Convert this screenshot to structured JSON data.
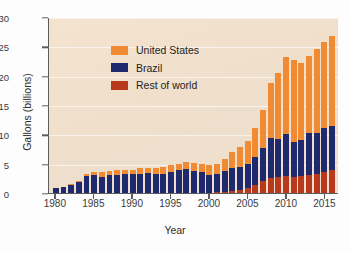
{
  "chart_data": {
    "type": "bar",
    "stacked": true,
    "title": "",
    "xlabel": "Year",
    "ylabel": "Gallons (billions)",
    "ylim": [
      0,
      30
    ],
    "ytick_values": [
      0,
      5,
      10,
      15,
      20,
      25,
      30
    ],
    "ytick_labels": [
      "0",
      "5",
      "10",
      "15",
      "20",
      "25",
      "30"
    ],
    "xtick_labels": [
      "1980",
      "1985",
      "1990",
      "1995",
      "2000",
      "2005",
      "2010",
      "2015"
    ],
    "grid": true,
    "legend_position": "top-left",
    "categories": [
      "1980",
      "1981",
      "1982",
      "1983",
      "1984",
      "1985",
      "1986",
      "1987",
      "1988",
      "1989",
      "1990",
      "1991",
      "1992",
      "1993",
      "1994",
      "1995",
      "1996",
      "1997",
      "1998",
      "1999",
      "2000",
      "2001",
      "2002",
      "2003",
      "2004",
      "2005",
      "2006",
      "2007",
      "2008",
      "2009",
      "2010",
      "2011",
      "2012",
      "2013",
      "2014",
      "2015",
      "2016"
    ],
    "series": [
      {
        "name": "Rest of world",
        "color": "#b8391b",
        "values": [
          0.0,
          0.0,
          0.0,
          0.0,
          0.0,
          0.0,
          0.0,
          0.0,
          0.0,
          0.0,
          0.0,
          0.0,
          0.0,
          0.0,
          0.0,
          0.0,
          0.0,
          0.0,
          0.0,
          0.0,
          0.0,
          0.1,
          0.2,
          0.3,
          0.5,
          0.8,
          1.4,
          2.1,
          2.5,
          2.7,
          2.9,
          2.8,
          2.9,
          3.1,
          3.3,
          3.6,
          3.9
        ]
      },
      {
        "name": "Brazil",
        "color": "#1f2a6e",
        "values": [
          0.8,
          1.0,
          1.4,
          1.9,
          2.9,
          3.0,
          2.8,
          3.0,
          3.1,
          3.2,
          3.2,
          3.3,
          3.4,
          3.3,
          3.3,
          3.5,
          3.9,
          4.1,
          3.8,
          3.5,
          3.1,
          3.2,
          3.5,
          3.9,
          4.0,
          4.2,
          4.8,
          5.6,
          6.9,
          6.5,
          7.1,
          5.9,
          6.1,
          7.1,
          7.0,
          7.4,
          7.5
        ]
      },
      {
        "name": "United States",
        "color": "#f08b33",
        "values": [
          0.0,
          0.1,
          0.1,
          0.2,
          0.3,
          0.6,
          0.7,
          0.8,
          0.8,
          0.8,
          0.8,
          0.9,
          0.9,
          1.0,
          1.2,
          1.3,
          1.0,
          1.2,
          1.3,
          1.4,
          1.6,
          1.6,
          2.1,
          2.8,
          3.4,
          3.9,
          4.9,
          6.5,
          9.3,
          11.3,
          13.2,
          13.9,
          13.2,
          13.2,
          14.3,
          14.8,
          15.3
        ]
      }
    ]
  },
  "legend": {
    "items": [
      {
        "label": "United States",
        "color": "#f08b33"
      },
      {
        "label": "Brazil",
        "color": "#1f2a6e"
      },
      {
        "label": "Rest of world",
        "color": "#b8391b"
      }
    ]
  }
}
